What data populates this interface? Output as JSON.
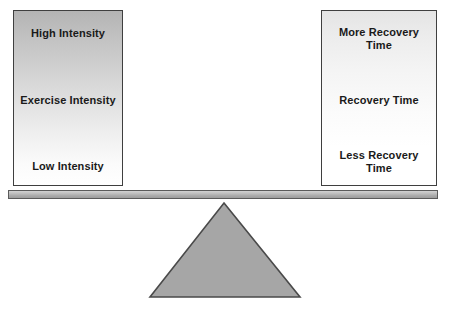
{
  "diagram": {
    "type": "seesaw-balance",
    "colors": {
      "background": "#ffffff",
      "panel_border": "#3f3f3f",
      "panel_gradient_dark": "#b4b4b4",
      "panel_gradient_light": "#ffffff",
      "plank_fill": "#bfbfbf",
      "plank_border": "#5b5b5b",
      "fulcrum_fill": "#a6a6a6",
      "fulcrum_border": "#4a4a4a",
      "text": "#1a1a1a"
    },
    "left_panel": {
      "name": "exercise-intensity-scale",
      "top_label": "High Intensity",
      "middle_label": "Exercise Intensity",
      "bottom_label": "Low Intensity"
    },
    "right_panel": {
      "name": "recovery-time-scale",
      "top_label": "More Recovery Time",
      "middle_label": "Recovery Time",
      "bottom_label": "Less Recovery Time"
    },
    "fulcrum": {
      "name": "fulcrum-triangle",
      "shape": "triangle"
    },
    "plank": {
      "name": "balance-beam",
      "shape": "horizontal-bar"
    }
  }
}
